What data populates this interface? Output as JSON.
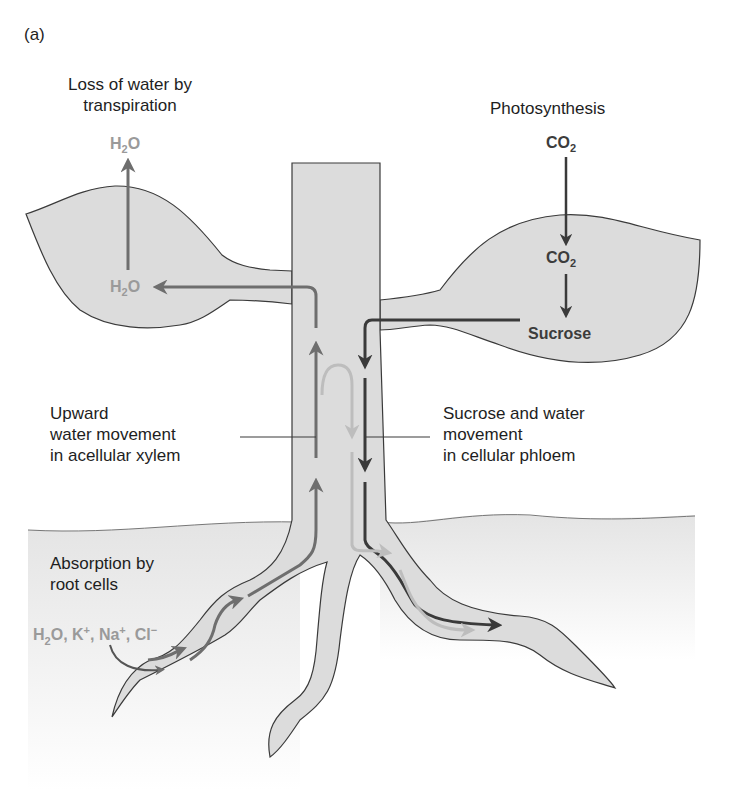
{
  "panel_label": "(a)",
  "labels": {
    "transpiration_line1": "Loss of water by",
    "transpiration_line2": "transpiration",
    "photosynthesis": "Photosynthesis",
    "xylem_line1": "Upward",
    "xylem_line2": "water movement",
    "xylem_line3": "in acellular xylem",
    "phloem_line1": "Sucrose and water",
    "phloem_line2": "movement",
    "phloem_line3": "in cellular phloem",
    "absorption_line1": "Absorption by",
    "absorption_line2": "root cells"
  },
  "chemicals": {
    "h2o_top": {
      "base": "H",
      "sub": "2",
      "tail": "O"
    },
    "h2o_leaf": {
      "base": "H",
      "sub": "2",
      "tail": "O"
    },
    "co2_top": {
      "base": "CO",
      "sub": "2"
    },
    "co2_leaf": {
      "base": "CO",
      "sub": "2"
    },
    "sucrose": "Sucrose",
    "ions": {
      "h": "H",
      "h_sub": "2",
      "o": "O, K",
      "k_sup": "+",
      "na": ", Na",
      "na_sup": "+",
      "cl": ", Cl",
      "cl_sup": "−"
    }
  },
  "colors": {
    "plant_fill": "#dcdcdc",
    "outline": "#3a3a3a",
    "xylem_arrow": "#6e6e6e",
    "phloem_arrow": "#3a3a3a",
    "light_arrow": "#bdbdbd",
    "grey_text": "#9a9a9a",
    "soil_fill": "#eeeeee"
  }
}
